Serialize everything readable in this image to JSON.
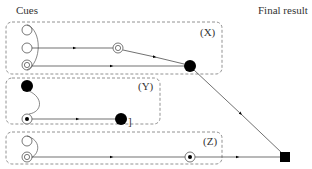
{
  "headers": {
    "cues": "Cues",
    "final_result": "Final result"
  },
  "groups": [
    {
      "id": "X",
      "label": "(X)"
    },
    {
      "id": "Y",
      "label": "(Y)"
    },
    {
      "id": "Z",
      "label": "(Z)"
    }
  ],
  "annotations": {
    "y_bracket": "]"
  },
  "node_legend": {
    "open-circle": "empty cue",
    "double-circle": "active cue",
    "filled-circle": "intermediate result",
    "circled-dot": "selected cue",
    "filled-square": "final result"
  },
  "colors": {
    "stroke": "#333333",
    "dash": "#777777",
    "fill": "#000000"
  }
}
